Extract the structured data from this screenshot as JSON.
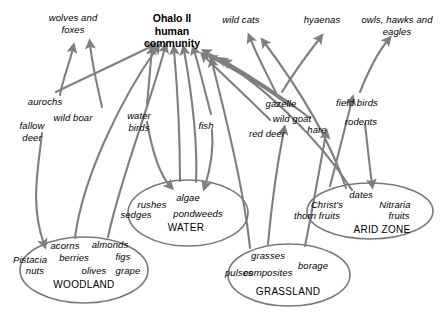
{
  "diagram": {
    "title_lines": [
      "Ohalo  II",
      "human",
      "community"
    ],
    "line_color": "#7f7f7f",
    "ellipse_color": "#7a7a7a",
    "text_color": "#000000",
    "background": "#ffffff"
  },
  "predators": [
    {
      "id": "wolves-and-foxes",
      "lines": [
        "wolves and",
        "foxes"
      ],
      "x": 73,
      "y": 12
    },
    {
      "id": "wild-cats",
      "lines": [
        "wild cats"
      ],
      "x": 241,
      "y": 14
    },
    {
      "id": "hyaenas",
      "lines": [
        "hyaenas"
      ],
      "x": 322,
      "y": 14
    },
    {
      "id": "owls-hawks-and-eagles",
      "lines": [
        "owls, hawks and",
        "eagles"
      ],
      "x": 397,
      "y": 14
    }
  ],
  "human_community": {
    "x": 172,
    "y": 12
  },
  "animals": [
    {
      "id": "aurochs",
      "lines": [
        "aurochs"
      ],
      "x": 45,
      "y": 96
    },
    {
      "id": "wild-boar",
      "lines": [
        "wild boar"
      ],
      "x": 73,
      "y": 112
    },
    {
      "id": "fallow-deer",
      "lines": [
        "fallow",
        "deer"
      ],
      "x": 32,
      "y": 120
    },
    {
      "id": "water-birds",
      "lines": [
        "water",
        "birds"
      ],
      "x": 139,
      "y": 110
    },
    {
      "id": "fish",
      "lines": [
        "fish"
      ],
      "x": 206,
      "y": 120
    },
    {
      "id": "gazelle",
      "lines": [
        "gazelle"
      ],
      "x": 281,
      "y": 98
    },
    {
      "id": "wild-goat",
      "lines": [
        "wild goat"
      ],
      "x": 292,
      "y": 113
    },
    {
      "id": "red-deer",
      "lines": [
        "red deer"
      ],
      "x": 267,
      "y": 128
    },
    {
      "id": "hare",
      "lines": [
        "hare"
      ],
      "x": 317,
      "y": 124
    },
    {
      "id": "field-birds",
      "lines": [
        "field birds"
      ],
      "x": 357,
      "y": 97
    },
    {
      "id": "rodents",
      "lines": [
        "rodents"
      ],
      "x": 361,
      "y": 116
    }
  ],
  "zones": [
    {
      "id": "woodland",
      "name": "WOODLAND",
      "cx": 84,
      "cy": 270,
      "rx": 64,
      "ry": 33,
      "name_x": 84,
      "name_y": 279,
      "items": [
        {
          "text": "acorns",
          "x": 65,
          "y": 240
        },
        {
          "text": "almonds",
          "x": 110,
          "y": 239
        },
        {
          "text": "berries",
          "x": 74,
          "y": 252
        },
        {
          "text": "figs",
          "x": 123,
          "y": 251
        },
        {
          "text": "Pistacia",
          "x": 30,
          "y": 254
        },
        {
          "text": "nuts",
          "x": 35,
          "y": 265
        },
        {
          "text": "olives",
          "x": 94,
          "y": 265
        },
        {
          "text": "grape",
          "x": 128,
          "y": 265
        }
      ]
    },
    {
      "id": "water",
      "name": "WATER",
      "cx": 188,
      "cy": 213,
      "rx": 60,
      "ry": 33,
      "name_x": 186,
      "name_y": 222,
      "items": [
        {
          "text": "rushes",
          "x": 152,
          "y": 199
        },
        {
          "text": "algae",
          "x": 188,
          "y": 192
        },
        {
          "text": "sedges",
          "x": 136,
          "y": 209
        },
        {
          "text": "pondweeds",
          "x": 198,
          "y": 208
        }
      ]
    },
    {
      "id": "grassland",
      "name": "GRASSLAND",
      "cx": 289,
      "cy": 275,
      "rx": 61,
      "ry": 31,
      "name_x": 288,
      "name_y": 286,
      "items": [
        {
          "text": "grasses",
          "x": 268,
          "y": 250
        },
        {
          "text": "pulses",
          "x": 239,
          "y": 267
        },
        {
          "text": "composites",
          "x": 268,
          "y": 267
        },
        {
          "text": "borage",
          "x": 313,
          "y": 260
        }
      ]
    },
    {
      "id": "arid-zone",
      "name": "ARID ZONE",
      "cx": 370,
      "cy": 211,
      "rx": 63,
      "ry": 28,
      "name_x": 382,
      "name_y": 224,
      "items": [
        {
          "text": "dates",
          "x": 361,
          "y": 189
        },
        {
          "text": "Christ's",
          "x": 327,
          "y": 199
        },
        {
          "text": "thorn fruits",
          "x": 317,
          "y": 210
        },
        {
          "text": "Nitraria",
          "x": 395,
          "y": 199
        },
        {
          "text": "fruits",
          "x": 399,
          "y": 210
        }
      ]
    }
  ],
  "links": [
    {
      "from": "aurochs",
      "to": "wolves-and-foxes",
      "d": "M 60 95 C 63 78 70 62 73 48"
    },
    {
      "from": "aurochs",
      "to": "human-community",
      "d": "M 56 92 C 80 80 120 62 152 46"
    },
    {
      "from": "wild-boar",
      "to": "wolves-and-foxes",
      "d": "M 102 107 C 97 85 92 64 90 44"
    },
    {
      "from": "fallow-deer",
      "to": "woodland",
      "d": "M 42 133 C 38 170 30 205 44 244"
    },
    {
      "from": "woodland",
      "to": "human-community",
      "d": "M 75 238 C 82 180 120 100 157 48"
    },
    {
      "from": "woodland2",
      "to": "human-community",
      "d": "M 108 237 C 120 180 148 110 165 48"
    },
    {
      "from": "water-birds",
      "to": "human-community",
      "d": "M 147 104 C 149 85 150 68 152 50"
    },
    {
      "from": "water-birds",
      "to": "water",
      "d": "M 147 122 C 152 150 160 175 170 186"
    },
    {
      "from": "water",
      "to": "human-community",
      "d": "M 180 181 C 180 140 178 95 174 50"
    },
    {
      "from": "water2",
      "to": "human-community",
      "d": "M 196 182 C 198 140 192 95 184 50"
    },
    {
      "from": "fish",
      "to": "human-community",
      "d": "M 211 114 C 205 92 200 70 194 50"
    },
    {
      "from": "fish",
      "to": "water",
      "d": "M 212 130 C 214 152 210 170 205 186"
    },
    {
      "from": "red-deer",
      "to": "human-community",
      "d": "M 270 120 C 250 100 222 74 204 56"
    },
    {
      "from": "gazelle",
      "to": "human-community",
      "d": "M 275 94 C 255 82 232 68 212 58"
    },
    {
      "from": "gazelle",
      "to": "wild-cats",
      "d": "M 276 93 C 268 76 258 58 250 38"
    },
    {
      "from": "gazelle",
      "to": "hyaenas",
      "d": "M 282 92 C 293 74 306 56 320 38"
    },
    {
      "from": "wild-goat",
      "to": "human-community",
      "d": "M 290 106 C 268 90 245 74 222 60"
    },
    {
      "from": "grassland",
      "to": "red-deer-link",
      "d": "M 268 244 C 272 200 278 160 284 130"
    },
    {
      "from": "grassland",
      "to": "human-community",
      "d": "M 250 248 C 244 190 226 118 212 62"
    },
    {
      "from": "hare",
      "to": "human-community",
      "d": "M 310 118 C 286 100 254 78 226 62"
    },
    {
      "from": "grassland2",
      "to": "hare-link",
      "d": "M 305 246 C 314 202 320 165 326 134"
    },
    {
      "from": "arid-zone",
      "to": "hare-link2",
      "d": "M 330 186 C 337 160 344 132 352 100"
    },
    {
      "from": "field-birds",
      "to": "owls-hawks-and-eagles",
      "d": "M 360 92 C 368 72 378 52 388 40"
    },
    {
      "from": "rodents",
      "to": "arid-zone",
      "d": "M 365 124 C 368 150 370 170 372 184"
    },
    {
      "from": "arid-zone2",
      "to": "human-community",
      "d": "M 352 190 C 320 140 260 80 206 52"
    },
    {
      "from": "arid-zone3",
      "to": "wild-cats",
      "d": "M 346 188 C 330 140 300 90 264 42"
    }
  ]
}
